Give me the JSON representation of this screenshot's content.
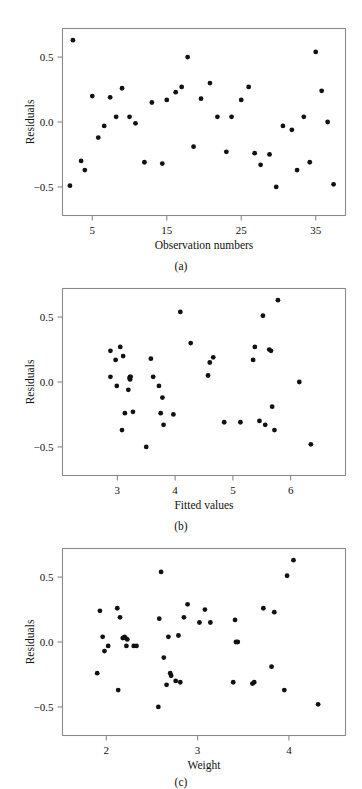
{
  "figure": {
    "background": "#ffffff",
    "point_color": "#111111",
    "axis_color": "#8a8a8a",
    "panels": [
      "a",
      "b",
      "c"
    ]
  },
  "panel_a": {
    "caption": "(a)",
    "ylabel": "Residuals",
    "xlabel": "Observation numbers",
    "xticks": [
      "5",
      "15",
      "25",
      "35"
    ],
    "yticks": [
      "0.5",
      "0.0",
      "-0.5"
    ]
  },
  "panel_b": {
    "caption": "(b)",
    "ylabel": "Residuals",
    "xlabel": "Fitted values",
    "xticks": [
      "3",
      "4",
      "5",
      "6"
    ],
    "yticks": [
      "0.5",
      "0.0",
      "-0.5"
    ]
  },
  "panel_c": {
    "caption": "(c)",
    "ylabel": "Residuals",
    "xlabel": "Weight",
    "xticks": [
      "2",
      "3",
      "4"
    ],
    "yticks": [
      "0.5",
      "0.0",
      "-0.5"
    ]
  },
  "chart_data": [
    {
      "type": "scatter",
      "id": "a",
      "title": "",
      "xlabel": "Observation numbers",
      "ylabel": "Residuals",
      "xlim": [
        1.0,
        39.0
      ],
      "ylim": [
        -0.72,
        0.72
      ],
      "xticks": [
        5,
        15,
        25,
        35
      ],
      "yticks": [
        -0.5,
        0.0,
        0.5
      ],
      "grid": false,
      "legend": null,
      "x": [
        2.0,
        2.4,
        3.5,
        4.0,
        5.0,
        5.8,
        6.6,
        7.4,
        8.2,
        9.0,
        10.0,
        10.8,
        12.0,
        13.0,
        14.4,
        15.0,
        16.2,
        17.0,
        17.8,
        18.6,
        19.6,
        20.8,
        21.8,
        23.0,
        23.7,
        25.0,
        26.0,
        26.8,
        27.6,
        28.8,
        29.7,
        30.6,
        31.8,
        32.5,
        33.4,
        34.2,
        35.0,
        35.8,
        36.6,
        37.4
      ],
      "y": [
        -0.49,
        0.63,
        -0.3,
        -0.37,
        0.2,
        -0.12,
        -0.03,
        0.19,
        0.04,
        0.26,
        0.04,
        -0.01,
        -0.31,
        0.15,
        -0.32,
        0.17,
        0.23,
        0.27,
        0.5,
        -0.19,
        0.18,
        0.3,
        0.04,
        -0.23,
        0.04,
        0.17,
        0.27,
        -0.24,
        -0.33,
        -0.25,
        -0.5,
        -0.03,
        -0.06,
        -0.37,
        0.04,
        -0.31,
        0.54,
        0.24,
        0.0,
        -0.48
      ]
    },
    {
      "type": "scatter",
      "id": "b",
      "title": "",
      "xlabel": "Fitted values",
      "ylabel": "Residuals",
      "xlim": [
        2.05,
        6.95
      ],
      "ylim": [
        -0.72,
        0.72
      ],
      "xticks": [
        3,
        4,
        5,
        6
      ],
      "yticks": [
        -0.5,
        0.0,
        0.5
      ],
      "grid": false,
      "legend": null,
      "x": [
        2.88,
        2.88,
        2.97,
        2.99,
        3.05,
        3.08,
        3.1,
        3.13,
        3.19,
        3.21,
        3.22,
        3.22,
        3.23,
        3.27,
        3.5,
        3.58,
        3.62,
        3.72,
        3.75,
        3.78,
        3.8,
        3.97,
        4.09,
        4.27,
        4.57,
        4.6,
        4.66,
        4.85,
        5.13,
        5.35,
        5.38,
        5.46,
        5.52,
        5.56,
        5.63,
        5.66,
        5.68,
        5.72,
        5.78,
        6.15,
        6.35
      ],
      "y": [
        0.24,
        0.04,
        0.17,
        -0.03,
        0.27,
        -0.37,
        0.2,
        -0.24,
        -0.06,
        0.03,
        0.04,
        0.02,
        0.04,
        -0.23,
        -0.5,
        0.18,
        0.04,
        -0.03,
        -0.24,
        -0.12,
        -0.33,
        -0.25,
        0.54,
        0.3,
        0.05,
        0.15,
        0.19,
        -0.31,
        -0.31,
        0.17,
        0.27,
        -0.3,
        0.51,
        -0.33,
        0.25,
        0.24,
        -0.19,
        -0.37,
        0.63,
        0.0,
        -0.48
      ]
    },
    {
      "type": "scatter",
      "id": "c",
      "title": "",
      "xlabel": "Weight",
      "ylabel": "Residuals",
      "xlim": [
        1.52,
        4.62
      ],
      "ylim": [
        -0.72,
        0.72
      ],
      "xticks": [
        2,
        3,
        4
      ],
      "yticks": [
        -0.5,
        0.0,
        0.5
      ],
      "grid": false,
      "legend": null,
      "x": [
        1.9,
        1.93,
        1.96,
        1.98,
        2.02,
        2.12,
        2.13,
        2.15,
        2.18,
        2.2,
        2.21,
        2.22,
        2.23,
        2.3,
        2.33,
        2.57,
        2.58,
        2.6,
        2.63,
        2.66,
        2.68,
        2.7,
        2.71,
        2.76,
        2.79,
        2.81,
        2.85,
        2.89,
        3.02,
        3.08,
        3.14,
        3.39,
        3.41,
        3.42,
        3.44,
        3.6,
        3.62,
        3.72,
        3.81,
        3.84,
        3.95,
        3.98,
        4.05,
        4.32
      ],
      "y": [
        -0.24,
        0.24,
        0.04,
        -0.07,
        -0.03,
        0.26,
        -0.37,
        0.19,
        0.03,
        0.04,
        0.03,
        -0.03,
        0.02,
        -0.03,
        -0.03,
        -0.5,
        0.18,
        0.54,
        -0.12,
        -0.33,
        0.04,
        -0.24,
        -0.26,
        -0.3,
        0.05,
        -0.31,
        0.19,
        0.29,
        0.15,
        0.25,
        0.15,
        -0.31,
        0.17,
        0.0,
        0.0,
        -0.32,
        -0.31,
        0.26,
        -0.19,
        0.23,
        -0.37,
        0.51,
        0.63,
        -0.48
      ]
    }
  ]
}
